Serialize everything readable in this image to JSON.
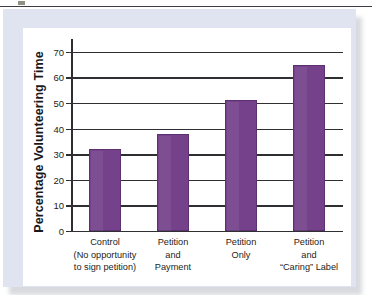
{
  "figure": {
    "panel_bg": "#dfe4f0",
    "card_bg": "#ffffff",
    "bar_color": "#74418a",
    "bar_border": "#5d3170",
    "axis_color": "#2f2f33"
  },
  "chart_data": {
    "type": "bar",
    "title": "",
    "xlabel": "",
    "ylabel": "Percentage Volunteering Time",
    "ylim": [
      0,
      75
    ],
    "yticks": [
      0,
      10,
      20,
      30,
      40,
      50,
      60,
      70
    ],
    "ytick_labels": [
      "0",
      "10",
      "20",
      "30",
      "40",
      "50",
      "60",
      "70"
    ],
    "grid": true,
    "legend": null,
    "categories": [
      "Control (No opportunity to sign petition)",
      "Petition and Payment",
      "Petition Only",
      "Petition and “Caring” Label"
    ],
    "category_lines": [
      [
        "Control",
        "(No opportunity",
        "to sign petition)"
      ],
      [
        "Petition",
        "and",
        "Payment"
      ],
      [
        "Petition",
        "Only"
      ],
      [
        "Petition",
        "and",
        "“Caring” Label"
      ]
    ],
    "values": [
      32,
      38,
      51,
      65
    ],
    "series": [
      {
        "name": "Percentage Volunteering Time",
        "values": [
          32,
          38,
          51,
          65
        ]
      }
    ]
  }
}
